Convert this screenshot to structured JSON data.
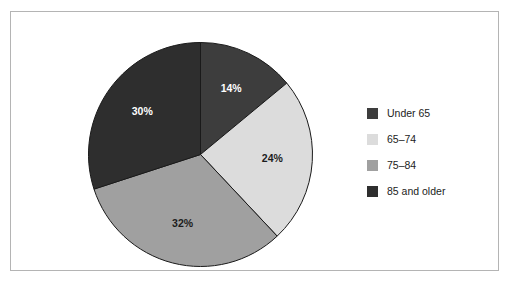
{
  "chart_data": {
    "type": "pie",
    "title": "",
    "subtitle": "",
    "xlabel": "",
    "ylabel": "",
    "grid": false,
    "legend_position": "right",
    "start_angle_deg": 0,
    "direction": "clockwise",
    "categories": [
      "Under 65",
      "65–74",
      "75–84",
      "85 and older"
    ],
    "values": [
      14,
      24,
      32,
      30
    ],
    "value_labels": [
      "14%",
      "24%",
      "32%",
      "30%"
    ],
    "colors": [
      "#3d3d3d",
      "#dcdcdc",
      "#a0a0a0",
      "#2e2e2e"
    ],
    "label_text_colors": [
      "#ffffff",
      "#1c1c1c",
      "#1c1c1c",
      "#ffffff"
    ],
    "slice_edge_color": "#1a1a1a",
    "frame_color": "#b4b4b4",
    "background_color": "#ffffff"
  },
  "legend": {
    "items": [
      {
        "label": "Under 65",
        "color": "#3d3d3d"
      },
      {
        "label": "65–74",
        "color": "#dcdcdc"
      },
      {
        "label": "75–84",
        "color": "#a0a0a0"
      },
      {
        "label": "85 and older",
        "color": "#2e2e2e"
      }
    ]
  },
  "slice_labels": {
    "s0": "14%",
    "s1": "24%",
    "s2": "32%",
    "s3": "30%"
  }
}
